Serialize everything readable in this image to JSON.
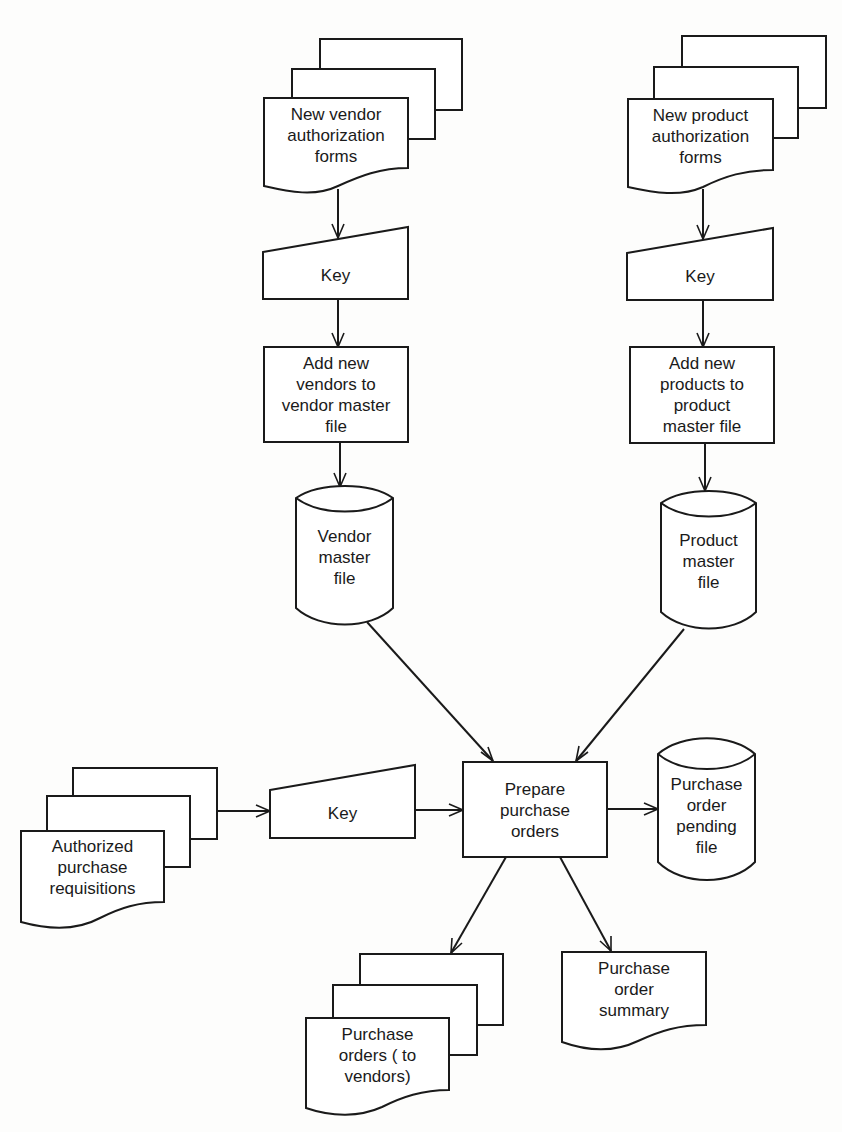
{
  "diagram": {
    "type": "system flowchart",
    "colors": {
      "stroke": "#1a1a1a",
      "fill": "#ffffff",
      "background": "#fdfdfc"
    },
    "nodes": {
      "vendor_forms": {
        "shape": "document-stack",
        "label": "New vendor\nauthorization\nforms"
      },
      "vendor_key": {
        "shape": "manual-input",
        "label": "Key"
      },
      "add_vendors": {
        "shape": "process",
        "label": "Add new\nvendors to\nvendor master\nfile"
      },
      "vendor_master": {
        "shape": "disk-storage",
        "label": "Vendor\nmaster\nfile"
      },
      "product_forms": {
        "shape": "document-stack",
        "label": "New product\nauthorization\nforms"
      },
      "product_key": {
        "shape": "manual-input",
        "label": "Key"
      },
      "add_products": {
        "shape": "process",
        "label": "Add new\nproducts to\nproduct\nmaster file"
      },
      "product_master": {
        "shape": "disk-storage",
        "label": "Product\nmaster\nfile"
      },
      "requisitions": {
        "shape": "document-stack",
        "label": "Authorized\npurchase\nrequisitions"
      },
      "req_key": {
        "shape": "manual-input",
        "label": "Key"
      },
      "prepare_po": {
        "shape": "process",
        "label": "Prepare\npurchase\norders"
      },
      "po_pending": {
        "shape": "disk-storage",
        "label": "Purchase\norder\npending\nfile"
      },
      "purchase_orders": {
        "shape": "document-stack",
        "label": "Purchase\norders ( to\nvendors)"
      },
      "po_summary": {
        "shape": "document",
        "label": "Purchase\norder\nsummary"
      }
    },
    "edges": [
      {
        "from": "vendor_forms",
        "to": "vendor_key"
      },
      {
        "from": "vendor_key",
        "to": "add_vendors"
      },
      {
        "from": "add_vendors",
        "to": "vendor_master"
      },
      {
        "from": "product_forms",
        "to": "product_key"
      },
      {
        "from": "product_key",
        "to": "add_products"
      },
      {
        "from": "add_products",
        "to": "product_master"
      },
      {
        "from": "vendor_master",
        "to": "prepare_po"
      },
      {
        "from": "product_master",
        "to": "prepare_po"
      },
      {
        "from": "requisitions",
        "to": "req_key"
      },
      {
        "from": "req_key",
        "to": "prepare_po"
      },
      {
        "from": "prepare_po",
        "to": "po_pending"
      },
      {
        "from": "prepare_po",
        "to": "purchase_orders"
      },
      {
        "from": "prepare_po",
        "to": "po_summary"
      }
    ]
  }
}
